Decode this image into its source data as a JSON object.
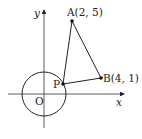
{
  "diagram": {
    "axes": {
      "x_label": "x",
      "y_label": "y",
      "origin_label": "O"
    },
    "points": {
      "A": {
        "label": "A(2, 5)",
        "x": 2,
        "y": 5
      },
      "B": {
        "label": "B(4, 1)",
        "x": 4,
        "y": 1
      },
      "P": {
        "label": "P"
      }
    },
    "circle": {
      "center": "O",
      "description": "circle centered at origin; P lies on circle"
    },
    "segments": [
      "PA",
      "AB",
      "PB"
    ],
    "colors": {
      "line": "#222222",
      "background": "#ffffff"
    }
  }
}
